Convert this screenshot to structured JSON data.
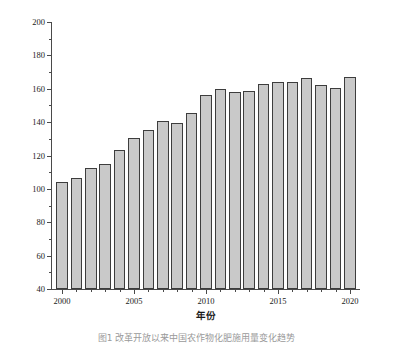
{
  "chart_data": {
    "type": "bar",
    "title": "",
    "xlabel": "年份",
    "ylabel": "单位面积化肥施用量/(kg/hm²)",
    "categories": [
      2000,
      2001,
      2002,
      2003,
      2004,
      2005,
      2006,
      2007,
      2008,
      2009,
      2010,
      2011,
      2012,
      2013,
      2014,
      2015,
      2016,
      2017,
      2018,
      2019,
      2020
    ],
    "values": [
      104.4,
      106.7,
      112.8,
      114.9,
      123.2,
      130.6,
      135.2,
      140.4,
      139.5,
      145.3,
      156.0,
      159.6,
      157.8,
      158.7,
      163.0,
      164.2,
      164.0,
      166.4,
      162.3,
      160.5,
      166.9
    ],
    "ylim": [
      40,
      200
    ],
    "xlim": [
      1999.3,
      2020.7
    ],
    "ytick_values": [
      40,
      60,
      80,
      100,
      120,
      140,
      160,
      180,
      200
    ],
    "ytick_labels": [
      "40",
      "60",
      "80",
      "100",
      "120",
      "140",
      "160",
      "180",
      "200"
    ],
    "yminor_values": [
      50,
      70,
      90,
      110,
      130,
      150,
      170,
      190
    ],
    "xtick_values": [
      2000,
      2005,
      2010,
      2015,
      2020
    ],
    "xtick_labels": [
      "2000",
      "2005",
      "2010",
      "2015",
      "2020"
    ],
    "grid": false,
    "legend": null,
    "bar_color": "#c9c9c9",
    "bar_edge_color": "#3d3d3d",
    "axis_color": "#4a4a4a"
  },
  "figure": {
    "caption": "图1  改革开放以来中国农作物化肥施用量变化趋势"
  }
}
